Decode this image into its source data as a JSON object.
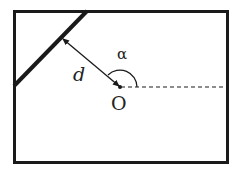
{
  "diagram": {
    "labels": {
      "distance": "d",
      "angle": "α",
      "origin": "O"
    },
    "colors": {
      "stroke": "#1a1a1a",
      "background": "#ffffff"
    }
  }
}
